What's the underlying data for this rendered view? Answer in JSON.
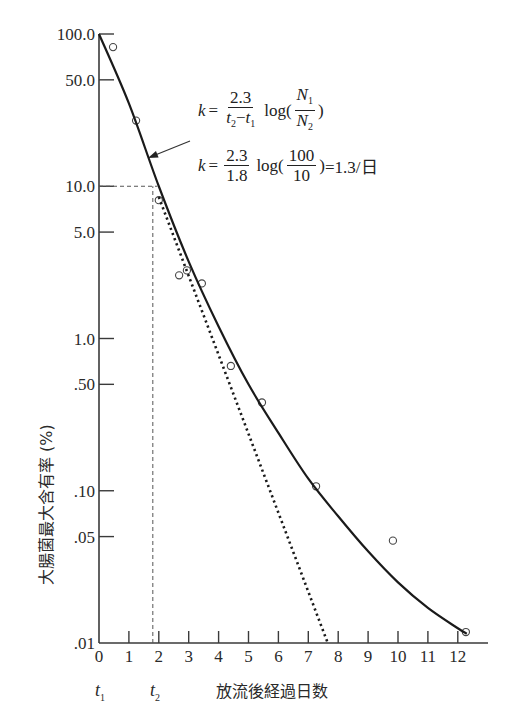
{
  "chart_data": {
    "type": "scatter",
    "title": "",
    "xlabel": "放流後経過日数",
    "ylabel": "大腸菌最大含有率 (%)",
    "yscale": "log",
    "xlim": [
      0,
      13
    ],
    "ylim": [
      0.01,
      100
    ],
    "grid": false,
    "x_ticks": [
      "0",
      "1",
      "2",
      "3",
      "4",
      "5",
      "6",
      "7",
      "8",
      "9",
      "10",
      "11",
      "12"
    ],
    "y_ticks": [
      {
        "value": 100,
        "label": "100.0"
      },
      {
        "value": 50,
        "label": "50.0"
      },
      {
        "value": 10,
        "label": "10.0"
      },
      {
        "value": 5,
        "label": "5.0"
      },
      {
        "value": 1,
        "label": "1.0"
      },
      {
        "value": 0.5,
        "label": ".50"
      },
      {
        "value": 0.1,
        "label": ".10"
      },
      {
        "value": 0.05,
        "label": ".05"
      },
      {
        "value": 0.01,
        "label": ".01"
      }
    ],
    "series": [
      {
        "name": "observed",
        "style": "open-circle",
        "x": [
          0.47,
          1.24,
          2.0,
          2.68,
          2.94,
          3.44,
          4.41,
          5.45,
          7.26,
          9.83,
          12.27
        ],
        "y": [
          82,
          27,
          8.1,
          2.6,
          2.8,
          2.3,
          0.66,
          0.38,
          0.107,
          0.047,
          0.0118
        ]
      },
      {
        "name": "fitted-curve",
        "style": "solid",
        "x": [
          0,
          1,
          2,
          3,
          4,
          5,
          6,
          7,
          8,
          9,
          10,
          11,
          12,
          12.3
        ],
        "y": [
          100,
          35,
          10,
          3.2,
          1.2,
          0.5,
          0.24,
          0.12,
          0.068,
          0.04,
          0.025,
          0.017,
          0.0125,
          0.0115
        ]
      },
      {
        "name": "initial-slope",
        "style": "dotted",
        "x": [
          2.0,
          7.65
        ],
        "y": [
          8.5,
          0.01
        ]
      }
    ],
    "annotations": [
      {
        "type": "dashed-horizontal",
        "y": 10,
        "x_from": 0,
        "x_to": 1.95
      },
      {
        "type": "dashed-vertical",
        "x": 1.8,
        "y_from": 0.01,
        "y_to": 10
      },
      {
        "type": "arrow",
        "from_px": [
          190,
          141
        ],
        "to_px": [
          148,
          158
        ]
      }
    ]
  },
  "formula": {
    "k_var": "k",
    "eq": "=",
    "line1": {
      "num": "2.3",
      "den_t2": "t",
      "den_sub2": "2",
      "den_minus": "−",
      "den_t1": "t",
      "den_sub1": "1",
      "log": "log(",
      "N1": "N",
      "N1_sub": "1",
      "N2": "N",
      "N2_sub": "2",
      "close": ")"
    },
    "line2": {
      "num": "2.3",
      "den": "1.8",
      "log": "log(",
      "num2": "100",
      "den2": "10",
      "close": ")",
      "result": "=1.3/日"
    }
  },
  "t_labels": {
    "t1": "t",
    "t1_sub": "1",
    "t2": "t",
    "t2_sub": "2"
  }
}
